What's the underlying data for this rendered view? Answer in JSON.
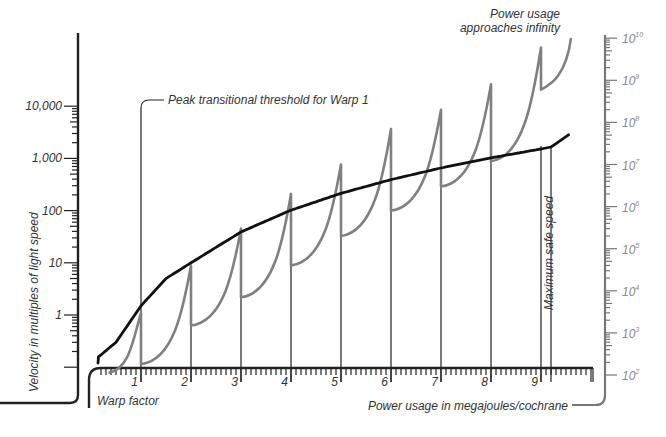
{
  "chart_data": {
    "type": "line",
    "title": "",
    "xlabel": "Warp factor",
    "xlabel_secondary": "Power usage in megajoules/cochrane",
    "ylabel": "Velocity in multiples of light speed",
    "ylabel_right": "Power usage (megajoules/cochrane)",
    "x_ticks": [
      "1",
      "2",
      "3",
      "4",
      "5",
      "6",
      "7",
      "8",
      "9"
    ],
    "xlim": [
      0,
      10
    ],
    "y_left_ticks": [
      "10,000",
      "1,000",
      "100",
      "10",
      "1"
    ],
    "y_left_scale": "log",
    "y_left_range": [
      0.1,
      100000
    ],
    "y_right_ticks": [
      {
        "base": "10",
        "exp": "10"
      },
      {
        "base": "10",
        "exp": "9"
      },
      {
        "base": "10",
        "exp": "8"
      },
      {
        "base": "10",
        "exp": "7"
      },
      {
        "base": "10",
        "exp": "6"
      },
      {
        "base": "10",
        "exp": "5"
      },
      {
        "base": "10",
        "exp": "4"
      },
      {
        "base": "10",
        "exp": "3"
      },
      {
        "base": "10",
        "exp": "2"
      }
    ],
    "y_right_scale": "log",
    "y_right_range": [
      100,
      10000000000
    ],
    "grid": false,
    "legend": "none",
    "series": [
      {
        "name": "Velocity (multiples of light speed)",
        "axis": "left",
        "color": "#111111",
        "x": [
          0.0,
          0.5,
          1.0,
          1.5,
          2.0,
          3.0,
          4.0,
          5.0,
          6.0,
          7.0,
          8.0,
          9.0,
          9.2,
          9.6
        ],
        "values": [
          0.12,
          0.3,
          1.5,
          5,
          10,
          39,
          102,
          214,
          392,
          656,
          1024,
          1516,
          1650,
          3053
        ]
      },
      {
        "name": "Power usage (megajoules/cochrane)",
        "axis": "right",
        "color": "#808080",
        "description": "Sawtooth: power peaks at each warp transitional threshold then drops; peaks rise toward infinity",
        "peak_x": [
          1,
          2,
          3,
          4,
          5,
          6,
          7,
          8,
          9
        ],
        "peak_values": [
          3000,
          40000,
          300000,
          2000000,
          10000000,
          70000000,
          200000000,
          800000000,
          6000000000
        ],
        "trough_values": [
          180,
          1500,
          7000,
          40000,
          200000,
          800000,
          3000000,
          12000000,
          600000000
        ]
      }
    ],
    "annotations": [
      {
        "text": "Peak transitional threshold for Warp 1",
        "x": 1
      },
      {
        "text": "Power usage approaches infinity",
        "x": 9.6
      },
      {
        "text": "Maximum safe speed",
        "x": 9.2
      }
    ]
  },
  "labels": {
    "ylabel": "Velocity in multiples of light speed",
    "xlabel": "Warp factor",
    "xlabel2": "Power usage in megajoules/cochrane",
    "ann_peak": "Peak transitional threshold for Warp 1",
    "ann_power1": "Power usage",
    "ann_power2": "approaches infinity",
    "ann_safe": "Maximum safe speed"
  }
}
